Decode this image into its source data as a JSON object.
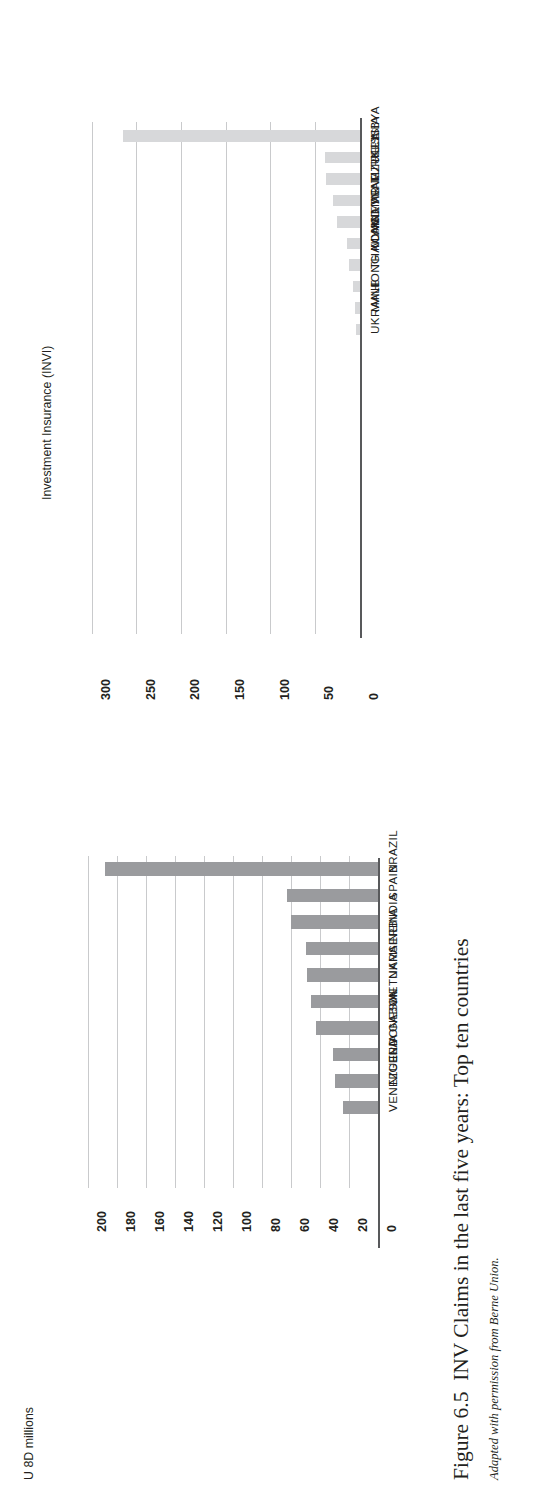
{
  "figure": {
    "number": "Figure 6.5",
    "title": "INV Claims in the last five years:  Top ten countries",
    "credit": "Adapted with permission from Berne Union.",
    "unit_label": "U 8D millions"
  },
  "chart_data": [
    {
      "id": "invi",
      "type": "bar",
      "orientation": "vertical",
      "title": "Investment Insurance (INVI)",
      "xlabel": "",
      "ylabel": "",
      "ylim": [
        0,
        300
      ],
      "yticks": [
        0,
        50,
        100,
        150,
        200,
        250,
        300
      ],
      "ticklabels": [
        "0",
        "50",
        "100",
        "150",
        "200",
        "250",
        "300"
      ],
      "grid": true,
      "bar_color": "#d7d8da",
      "categories": [
        "LIBYA",
        "RUSSIA",
        "TURKEY",
        "VENEZUELA",
        "VIETNAM",
        "MYANMAR",
        "THAILAND",
        "HONG KONG",
        "MALI",
        "UKRAINE"
      ],
      "values": [
        265,
        39,
        38,
        30,
        26,
        15,
        12,
        8,
        6,
        5
      ]
    },
    {
      "id": "export-credit",
      "type": "bar",
      "orientation": "vertical",
      "title": "United Export Credit/Sɔv. Non-payment",
      "xlabel": "",
      "ylabel": "",
      "ylim": [
        0,
        200
      ],
      "yticks": [
        0,
        20,
        40,
        60,
        80,
        100,
        120,
        140,
        160,
        180,
        200
      ],
      "ticklabels": [
        "0",
        "20",
        "40",
        "60",
        "80",
        "100",
        "120",
        "140",
        "160",
        "180",
        "200"
      ],
      "grid": true,
      "bar_color": "#9a9b9e",
      "categories": [
        "BRAZIL",
        "SPAIN",
        "INDIA",
        "SERBIA",
        "UKRAINE",
        "VIETNAM",
        "GABON",
        "INDONESIA",
        "NIGERIA",
        "VENEZUELA"
      ],
      "values": [
        188,
        63,
        60,
        50,
        49,
        46,
        43,
        31,
        30,
        24
      ]
    }
  ]
}
